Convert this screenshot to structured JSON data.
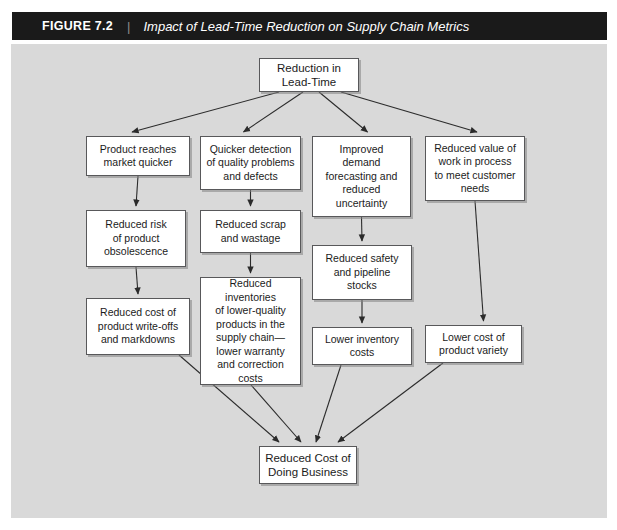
{
  "header": {
    "figure_number": "FIGURE 7.2",
    "separator": "|",
    "title": "Impact of Lead-Time Reduction on Supply Chain Metrics"
  },
  "colors": {
    "header_bar": "#1a1a1a",
    "panel_background": "#d9d9d9",
    "node_fill": "#ffffff",
    "node_border": "#58585a",
    "edge": "#2b2b2b",
    "page_background": "#ffffff"
  },
  "diagram": {
    "type": "flowchart",
    "orientation": "top-to-bottom",
    "nodes": [
      {
        "id": "root",
        "label": "Reduction in\nLead-Time",
        "x": 248,
        "y": 14,
        "w": 100,
        "h": 34
      },
      {
        "id": "prod_market",
        "label": "Product reaches\nmarket quicker",
        "x": 75,
        "y": 92,
        "w": 104,
        "h": 40
      },
      {
        "id": "quicker_det",
        "label": "Quicker detection\nof quality problems\nand defects",
        "x": 189,
        "y": 92,
        "w": 101,
        "h": 54
      },
      {
        "id": "improved_fc",
        "label": "Improved\ndemand\nforecasting and\nreduced\nuncertainty",
        "x": 301,
        "y": 92,
        "w": 99,
        "h": 81
      },
      {
        "id": "reduced_wip",
        "label": "Reduced value of\nwork in process\nto meet customer\nneeds",
        "x": 414,
        "y": 92,
        "w": 100,
        "h": 65
      },
      {
        "id": "risk_obso",
        "label": "Reduced risk\nof product\nobsolescence",
        "x": 75,
        "y": 166,
        "w": 100,
        "h": 57
      },
      {
        "id": "scrap",
        "label": "Reduced scrap\nand wastage",
        "x": 189,
        "y": 166,
        "w": 101,
        "h": 43
      },
      {
        "id": "safety",
        "label": "Reduced safety\nand pipeline\nstocks",
        "x": 301,
        "y": 201,
        "w": 100,
        "h": 55
      },
      {
        "id": "writeoffs",
        "label": "Reduced cost of\nproduct write-offs\nand markdowns",
        "x": 75,
        "y": 254,
        "w": 104,
        "h": 57
      },
      {
        "id": "inventories",
        "label": "Reduced inventories\nof lower-quality\nproducts in the\nsupply chain—\nlower warranty\nand correction\ncosts",
        "x": 189,
        "y": 233,
        "w": 101,
        "h": 108
      },
      {
        "id": "lower_inv",
        "label": "Lower inventory\ncosts",
        "x": 301,
        "y": 283,
        "w": 100,
        "h": 38
      },
      {
        "id": "lower_var",
        "label": "Lower cost of\nproduct variety",
        "x": 414,
        "y": 281,
        "w": 97,
        "h": 38
      },
      {
        "id": "sink",
        "label": "Reduced Cost of\nDoing Business",
        "x": 248,
        "y": 402,
        "w": 98,
        "h": 38
      }
    ],
    "edges": [
      {
        "from": "root",
        "to": "prod_market"
      },
      {
        "from": "root",
        "to": "quicker_det"
      },
      {
        "from": "root",
        "to": "improved_fc"
      },
      {
        "from": "root",
        "to": "reduced_wip"
      },
      {
        "from": "prod_market",
        "to": "risk_obso"
      },
      {
        "from": "quicker_det",
        "to": "scrap"
      },
      {
        "from": "improved_fc",
        "to": "safety"
      },
      {
        "from": "reduced_wip",
        "to": "lower_var"
      },
      {
        "from": "risk_obso",
        "to": "writeoffs"
      },
      {
        "from": "scrap",
        "to": "inventories"
      },
      {
        "from": "safety",
        "to": "lower_inv"
      },
      {
        "from": "writeoffs",
        "to": "sink"
      },
      {
        "from": "inventories",
        "to": "sink"
      },
      {
        "from": "lower_inv",
        "to": "sink"
      },
      {
        "from": "lower_var",
        "to": "sink"
      }
    ]
  }
}
